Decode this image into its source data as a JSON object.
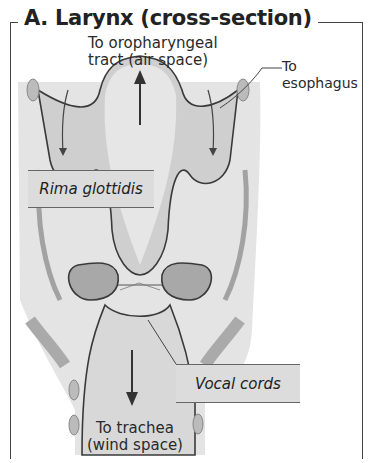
{
  "figure": {
    "title": "A. Larynx (cross-section)"
  },
  "labels": {
    "top_line1": "To oropharyngeal",
    "top_line2": "tract (air space)",
    "esophagus_line1": "To",
    "esophagus_line2": "esophagus",
    "rima": "Rima glottidis",
    "vocal": "Vocal cords",
    "bottom_line1": "To trachea",
    "bottom_line2": "(wind space)"
  },
  "colors": {
    "tissue_light": "#e2e2e2",
    "tissue_mid": "#bdbdbd",
    "tissue_dark": "#9a9a9a",
    "outline": "#3a3a3a",
    "label_box": "#dcdcdc"
  }
}
